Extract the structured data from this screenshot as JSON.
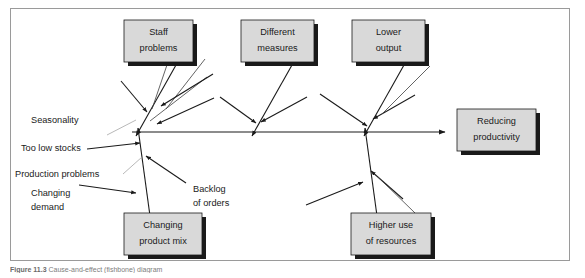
{
  "figure": {
    "caption_number": "Figure 11.3",
    "caption_text": "Cause-and-effect (fishbone) diagram"
  },
  "diagram": {
    "type": "fishbone",
    "effect": {
      "label_line1": "Reducing",
      "label_line2": "productivity"
    },
    "categories": [
      {
        "id": "staff-problems",
        "label_line1": "Staff",
        "label_line2": "problems",
        "position": "top"
      },
      {
        "id": "different-measures",
        "label_line1": "Different",
        "label_line2": "measures",
        "position": "top"
      },
      {
        "id": "lower-output",
        "label_line1": "Lower",
        "label_line2": "output",
        "position": "top"
      },
      {
        "id": "changing-product-mix",
        "label_line1": "Changing",
        "label_line2": "product mix",
        "position": "bottom"
      },
      {
        "id": "higher-use-of-resources",
        "label_line1": "Higher use",
        "label_line2": "of resources",
        "position": "bottom"
      }
    ],
    "causes": [
      {
        "id": "seasonality",
        "label_line1": "Seasonality",
        "label_line2": ""
      },
      {
        "id": "too-low-stocks",
        "label_line1": "Too low stocks",
        "label_line2": ""
      },
      {
        "id": "production-problems",
        "label_line1": "Production problems",
        "label_line2": ""
      },
      {
        "id": "changing-demand",
        "label_line1": "Changing",
        "label_line2": "demand"
      },
      {
        "id": "backlog-of-orders",
        "label_line1": "Backlog",
        "label_line2": "of orders"
      }
    ]
  },
  "colors": {
    "box_fill": "#d9d9d9",
    "box_border": "#1a1a1a",
    "box_shadow": "#1a1a1a",
    "line": "#1a1a1a",
    "twig": "#3c3c3c",
    "frame_border": "#9a9a9a",
    "background": "#ffffff",
    "caption_text": "#7d7d7d"
  }
}
